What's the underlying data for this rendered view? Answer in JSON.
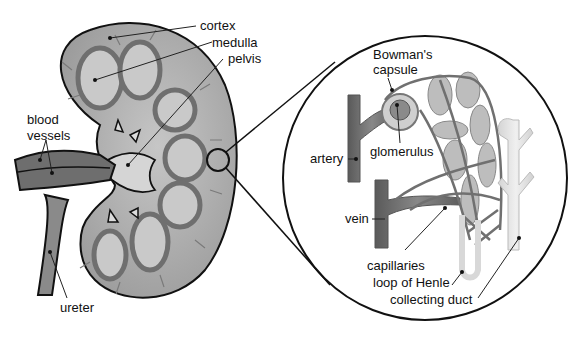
{
  "diagram": {
    "labels": {
      "cortex": "cortex",
      "medulla": "medulla",
      "pelvis": "pelvis",
      "blood_vessels_line1": "blood",
      "blood_vessels_line2": "vessels",
      "ureter": "ureter",
      "bowmans_capsule_line1": "Bowman's",
      "bowmans_capsule_line2": "capsule",
      "glomerulus": "glomerulus",
      "artery": "artery",
      "vein": "vein",
      "capillaries": "capillaries",
      "loop_of_henle": "loop of Henle",
      "collecting_duct": "collecting duct"
    },
    "colors": {
      "kidney_fill": "#a9a9a9",
      "kidney_outline": "#111111",
      "medulla_fill": "#c4c4c4",
      "vessel_fill": "#6e6e6e",
      "vessel_branch": "#7a7a7a",
      "pelvis_fill": "#d8d8d8",
      "artery_fill": "#6a6a6a",
      "nephron_fill": "#bdbdbd",
      "duct_fill": "#e2e2e2",
      "text": "#111111"
    }
  }
}
